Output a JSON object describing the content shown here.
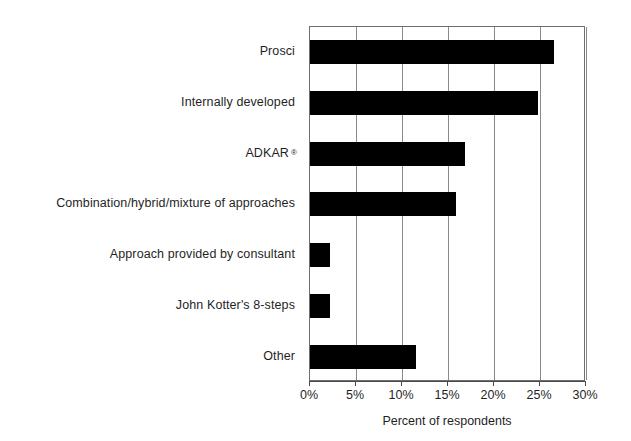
{
  "chart_data": {
    "type": "bar",
    "orientation": "horizontal",
    "title": "",
    "xlabel": "Percent of respondents",
    "ylabel": "",
    "xlim": [
      0,
      30
    ],
    "ylim": null,
    "grid": true,
    "legend": false,
    "legend_position": "none",
    "bar_color": "#000000",
    "categories": [
      "Prosci",
      "Internally developed",
      "ADKAR",
      "Combination/hybrid/mixture of approaches",
      "Approach provided by consultant",
      "John Kotter's 8-steps",
      "Other"
    ],
    "category_labels": [
      {
        "text": "Prosci",
        "trademark": ""
      },
      {
        "text": "Internally developed",
        "trademark": ""
      },
      {
        "text": "ADKAR",
        "trademark": "®"
      },
      {
        "text": "Combination/hybrid/mixture of approaches",
        "trademark": ""
      },
      {
        "text": "Approach provided by consultant",
        "trademark": ""
      },
      {
        "text": "John Kotter's 8-steps",
        "trademark": ""
      },
      {
        "text": "Other",
        "trademark": ""
      }
    ],
    "values": [
      26.5,
      24.8,
      16.9,
      15.9,
      2.2,
      2.2,
      11.5
    ],
    "value_unit": "%",
    "xticks": [
      0,
      5,
      10,
      15,
      20,
      25,
      30
    ],
    "xtick_labels": [
      "0%",
      "5%",
      "10%",
      "15%",
      "20%",
      "25%",
      "30%"
    ]
  }
}
